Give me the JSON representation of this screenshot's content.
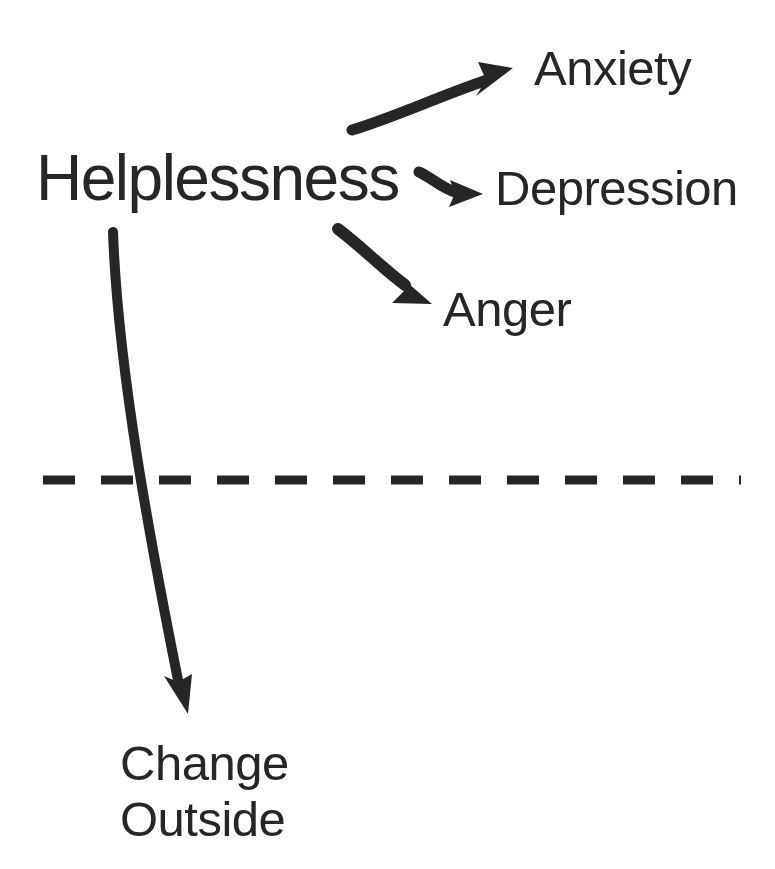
{
  "diagram": {
    "ink_color": "#262626",
    "background_color": "#ffffff",
    "source_node": {
      "id": "helplessness",
      "label": "Helplessness"
    },
    "outcome_nodes": [
      {
        "id": "anxiety",
        "label": "Anxiety"
      },
      {
        "id": "depression",
        "label": "Depression"
      },
      {
        "id": "anger",
        "label": "Anger"
      }
    ],
    "below_line_node": {
      "id": "change-outside",
      "line1": "Change",
      "line2": "Outside"
    },
    "divider": {
      "id": "dashed-divider",
      "style": "dashed",
      "orientation": "horizontal",
      "dash_length": 32,
      "gap_length": 26,
      "thickness": 9,
      "x_start": 43,
      "x_end": 741,
      "y": 480
    },
    "connectors": [
      {
        "id": "arrow-to-anxiety",
        "from": "helplessness",
        "to": "anxiety",
        "shape": "curved-up"
      },
      {
        "id": "arrow-to-depression",
        "from": "helplessness",
        "to": "depression",
        "shape": "short-curve-right"
      },
      {
        "id": "arrow-to-anger",
        "from": "helplessness",
        "to": "anger",
        "shape": "curved-down-right"
      },
      {
        "id": "arrow-to-change-outside",
        "from": "helplessness",
        "to": "change-outside",
        "shape": "long-curve-down"
      }
    ]
  }
}
